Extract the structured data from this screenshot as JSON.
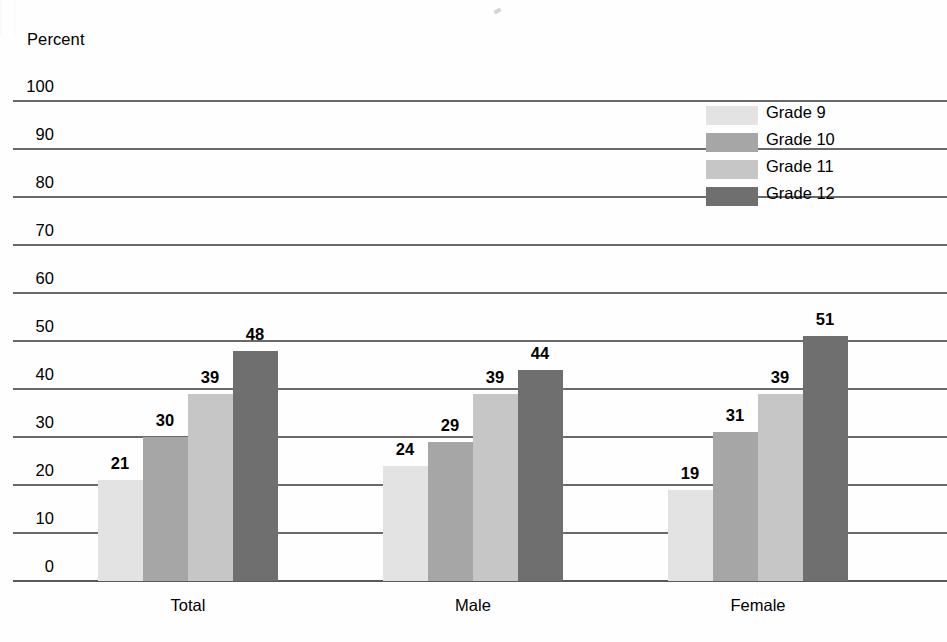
{
  "axis_title": "Percent",
  "legend": {
    "entries": [
      {
        "label": "Grade 9",
        "color": "#e3e3e3"
      },
      {
        "label": "Grade 10",
        "color": "#a6a6a6"
      },
      {
        "label": "Grade 11",
        "color": "#c6c6c6"
      },
      {
        "label": "Grade 12",
        "color": "#6f6f6f"
      }
    ]
  },
  "chart_data": {
    "type": "bar",
    "title": "",
    "xlabel": "",
    "ylabel": "Percent",
    "ylim": [
      0,
      100
    ],
    "yticks": [
      0,
      10,
      20,
      30,
      40,
      50,
      60,
      70,
      80,
      90,
      100
    ],
    "ytick_labels": [
      "0",
      "10",
      "20",
      "30",
      "40",
      "50",
      "60",
      "70",
      "80",
      "90",
      "100"
    ],
    "grid": true,
    "legend_position": "upper right",
    "categories": [
      "Total",
      "Male",
      "Female"
    ],
    "series": [
      {
        "name": "Grade 9",
        "color": "#e3e3e3",
        "values": [
          21,
          24,
          19
        ]
      },
      {
        "name": "Grade 10",
        "color": "#a6a6a6",
        "values": [
          30,
          29,
          31
        ]
      },
      {
        "name": "Grade 11",
        "color": "#c6c6c6",
        "values": [
          39,
          39,
          39
        ]
      },
      {
        "name": "Grade 12",
        "color": "#6f6f6f",
        "values": [
          48,
          44,
          51
        ]
      }
    ],
    "data_labels": [
      [
        "21",
        "30",
        "39",
        "48"
      ],
      [
        "24",
        "29",
        "39",
        "44"
      ],
      [
        "19",
        "31",
        "39",
        "51"
      ]
    ]
  }
}
